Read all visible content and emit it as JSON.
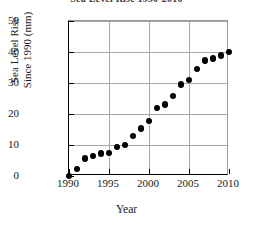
{
  "chart_data": {
    "type": "scatter",
    "title": "Sea Level Rise 1990-2010",
    "xlabel": "Year",
    "ylabel": "Sea Level Rise Since 1990 (mm)",
    "ylabel_line1": "Sea Level Rise",
    "ylabel_line2": "Since 1990 (mm)",
    "xlim": [
      1990,
      2010
    ],
    "ylim": [
      0,
      50
    ],
    "xticks": [
      1990,
      1995,
      2000,
      2005,
      2010
    ],
    "yticks": [
      0,
      10,
      20,
      30,
      40,
      50
    ],
    "xtick_labels": [
      "1990",
      "1995",
      "2000",
      "2005",
      "2010"
    ],
    "ytick_labels": [
      "0",
      "10",
      "20",
      "30",
      "40",
      "50"
    ],
    "grid": true,
    "grid_axis": "both",
    "legend": false,
    "marker": "filled-circle",
    "marker_color": "#000000",
    "x": [
      1990,
      1991,
      1992,
      1993,
      1994,
      1995,
      1996,
      1997,
      1998,
      1999,
      2000,
      2001,
      2002,
      2003,
      2004,
      2005,
      2006,
      2007,
      2008,
      2009,
      2010
    ],
    "values": [
      0,
      2.2,
      5.7,
      6.4,
      7.2,
      7.4,
      9.4,
      10.0,
      13.0,
      15.3,
      17.8,
      22.0,
      23.1,
      25.8,
      29.5,
      31.0,
      34.6,
      37.3,
      37.9,
      38.9,
      40.0
    ],
    "points": [
      {
        "x": 1990,
        "y": 0
      },
      {
        "x": 1991,
        "y": 2.2
      },
      {
        "x": 1992,
        "y": 5.7
      },
      {
        "x": 1993,
        "y": 6.4
      },
      {
        "x": 1994,
        "y": 7.2
      },
      {
        "x": 1995,
        "y": 7.4
      },
      {
        "x": 1996,
        "y": 9.4
      },
      {
        "x": 1997,
        "y": 10.0
      },
      {
        "x": 1998,
        "y": 13.0
      },
      {
        "x": 1999,
        "y": 15.3
      },
      {
        "x": 2000,
        "y": 17.8
      },
      {
        "x": 2001,
        "y": 22.0
      },
      {
        "x": 2002,
        "y": 23.1
      },
      {
        "x": 2003,
        "y": 25.8
      },
      {
        "x": 2004,
        "y": 29.5
      },
      {
        "x": 2005,
        "y": 31.0
      },
      {
        "x": 2006,
        "y": 34.6
      },
      {
        "x": 2007,
        "y": 37.3
      },
      {
        "x": 2008,
        "y": 37.9
      },
      {
        "x": 2009,
        "y": 38.9
      },
      {
        "x": 2010,
        "y": 40.0
      }
    ]
  }
}
